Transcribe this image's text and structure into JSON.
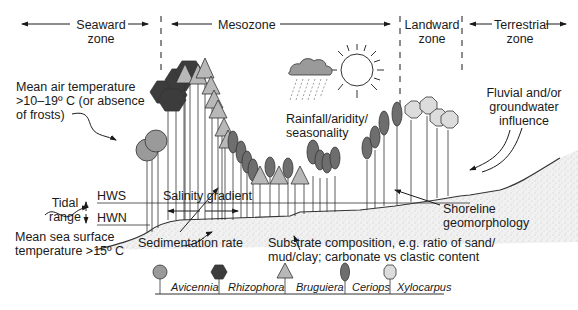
{
  "zones": [
    {
      "id": "seaward",
      "line1": "Seaward",
      "line2": "zone"
    },
    {
      "id": "mesozone",
      "line1": "Mesozone",
      "line2": ""
    },
    {
      "id": "landward",
      "line1": "Landward",
      "line2": "zone"
    },
    {
      "id": "terrestrial",
      "line1": "Terrestrial",
      "line2": "zone"
    }
  ],
  "annotations": {
    "air_temp": [
      "Mean air temperature",
      ">10–19º C (or absence",
      "of frosts)"
    ],
    "rainfall": [
      "Rainfall/aridity/",
      "seasonality"
    ],
    "fluvial": [
      "Fluvial and/or",
      "groundwater",
      "influence"
    ],
    "hws": "HWS",
    "hwn": "HWN",
    "tidal": [
      "Tidal",
      "range"
    ],
    "salinity": "Salinity gradient",
    "sea_temp": [
      "Mean sea surface",
      "temperature >15º C"
    ],
    "sedimentation": "Sedimentation rate",
    "substrate": [
      "Substrate composition, e.g. ratio of sand/",
      "mud/clay; carbonate vs clastic content"
    ],
    "shoreline": [
      "Shoreline",
      "geomorphology"
    ]
  },
  "legend": [
    {
      "genus": "Avicennia",
      "shape": "circle",
      "color": "#9a9a9a"
    },
    {
      "genus": "Rhizophora",
      "shape": "hexagon",
      "color": "#3c3c3c"
    },
    {
      "genus": "Bruguiera",
      "shape": "triangle",
      "color": "#b8b8b8"
    },
    {
      "genus": "Ceriops",
      "shape": "ellipse",
      "color": "#6e6e6e"
    },
    {
      "genus": "Xylocarpus",
      "shape": "octagon",
      "color": "#dcdcdc"
    }
  ],
  "icons": {
    "weather": "sun-cloud-rain-icon"
  }
}
